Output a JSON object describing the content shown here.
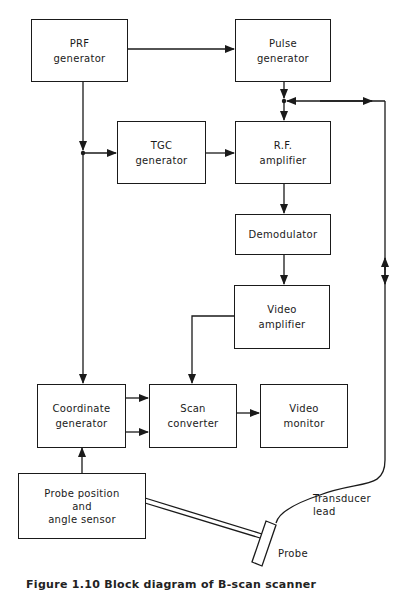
{
  "diagram": {
    "blocks": {
      "prf": {
        "line1": "PRF",
        "line2": "generator"
      },
      "pulse": {
        "line1": "Pulse",
        "line2": "generator"
      },
      "tgc": {
        "line1": "TGC",
        "line2": "generator"
      },
      "rf": {
        "line1": "R.F.",
        "line2": "amplifier"
      },
      "demod": {
        "line1": "Demodulator"
      },
      "video_amp": {
        "line1": "Video",
        "line2": "amplifier"
      },
      "coord": {
        "line1": "Coordinate",
        "line2": "generator"
      },
      "scan": {
        "line1": "Scan",
        "line2": "converter"
      },
      "monitor": {
        "line1": "Video",
        "line2": "monitor"
      },
      "probe_sensor": {
        "line1": "Probe position",
        "line2": "and",
        "line3": "angle sensor"
      }
    },
    "labels": {
      "transducer_line1": "Transducer",
      "transducer_line2": "lead",
      "probe": "Probe"
    },
    "caption": "Figure 1.10 Block diagram of B-scan scanner"
  }
}
